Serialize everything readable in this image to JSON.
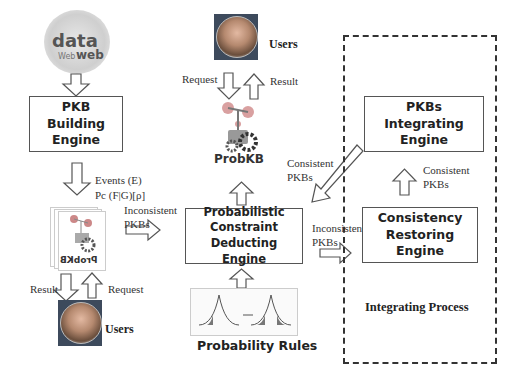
{
  "diagram": {
    "word_cloud": {
      "words": [
        "data",
        "Web",
        "web"
      ]
    },
    "engines": {
      "pkb_building": "PKB Building Engine",
      "probabilistic_constraint": "Probabilistic Constraint Deducting Engine",
      "pkbs_integrating": "PKBs Integrating Engine",
      "consistency_restoring": "Consistency Restoring Engine"
    },
    "labels": {
      "events": "Events (E)",
      "pc": "Pc (F|G)[ρ]",
      "inconsistent_pkbs_1": [
        "Inconsistent",
        "PKBs"
      ],
      "inconsistent_pkbs_2": [
        "Inconsistent",
        "PKBs"
      ],
      "consistent_pkbs_1": [
        "Consistent",
        "PKBs"
      ],
      "consistent_pkbs_2": [
        "Consistent",
        "PKBs"
      ],
      "request_top": "Request",
      "result_top": "Result",
      "request_bottom": "Request",
      "result_bottom": "Result",
      "users_top": "Users",
      "users_bottom": "Users",
      "probkb": "ProbKB",
      "probkb_mirrored": "ProbKB",
      "probability_rules": "Probability Rules",
      "integrating_process": "Integrating Process"
    }
  }
}
